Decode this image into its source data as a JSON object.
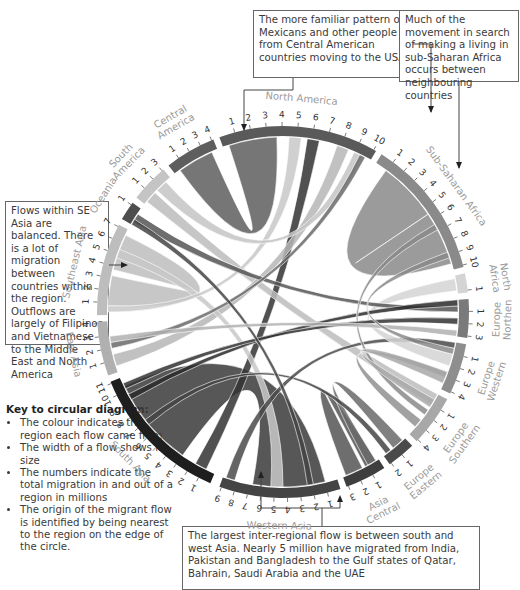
{
  "callouts": {
    "top": "The more familiar pattern of Mexicans and other people from Central American countries moving to the USA",
    "top_right": "Much of the movement in search of making a living in sub-Saharan Africa occurs between neighbouring countries",
    "left": "Flows within SE Asia are balanced. There is a lot of migration between countries within the region. Outflows are largely of Filipinos and Vietnamese to the Middle East and North America",
    "bottom": "The largest inter-regional flow is between south and west Asia. Nearly 5 million have migrated from India, Pakistan and Bangladesh to the Gulf states of Qatar, Bahrain, Saudi Arabia and the UAE"
  },
  "key": {
    "title": "Key to circular diagram:",
    "items": [
      "The colour indicates the region each flow came from",
      "The width of a flow shows its size",
      "The numbers indicate the total migration in and out of a region in millions",
      "The origin of the migrant flow is identified by being nearest to the region on the edge of the circle."
    ]
  },
  "chart_data": {
    "type": "chord",
    "title": "",
    "units": "millions (total migration in and out of a region)",
    "regions": [
      {
        "name": "North America",
        "label_lines": [
          "North America"
        ],
        "max_tick": 10,
        "color": "#5a5a5a",
        "start": -20,
        "end": 30
      },
      {
        "name": "Sub-Saharan Africa",
        "label_lines": [
          "Sub-Saharan Africa"
        ],
        "max_tick": 10,
        "color": "#8a8a8a",
        "start": 32,
        "end": 76
      },
      {
        "name": "North Africa",
        "label_lines": [
          "North",
          "Africa"
        ],
        "max_tick": 1,
        "color": "#d4d4d4",
        "start": 78,
        "end": 84
      },
      {
        "name": "Northern Europe",
        "label_lines": [
          "Northen",
          "Europe"
        ],
        "max_tick": 3,
        "color": "#7a7a7a",
        "start": 86,
        "end": 98
      },
      {
        "name": "Western Europe",
        "label_lines": [
          "Western",
          "Europe"
        ],
        "max_tick": 4,
        "color": "#8e8e8e",
        "start": 100,
        "end": 116
      },
      {
        "name": "Southern Europe",
        "label_lines": [
          "Southern",
          "Europe"
        ],
        "max_tick": 4,
        "color": "#a8a8a8",
        "start": 118,
        "end": 134
      },
      {
        "name": "Eastern Europe",
        "label_lines": [
          "Eastern",
          "Europe"
        ],
        "max_tick": 2,
        "color": "#4a4a4a",
        "start": 136,
        "end": 145
      },
      {
        "name": "Central Asia",
        "label_lines": [
          "Central",
          "Asia"
        ],
        "max_tick": 3,
        "color": "#3e3e3e",
        "start": 147,
        "end": 160
      },
      {
        "name": "Western Asia",
        "label_lines": [
          "Western Asia"
        ],
        "max_tick": 9,
        "color": "#444444",
        "start": 162,
        "end": 200
      },
      {
        "name": "South Asia",
        "label_lines": [
          "South Asia"
        ],
        "max_tick": 11,
        "color": "#1e1e1e",
        "start": 203,
        "end": 248
      },
      {
        "name": "East Asia",
        "label_lines": [
          "East Asia"
        ],
        "max_tick": 4,
        "color": "#b0b0b0",
        "start": 250,
        "end": 267
      },
      {
        "name": "Southeast Asia",
        "label_lines": [
          "Southeast Asia"
        ],
        "max_tick": 7,
        "color": "#bdbdbd",
        "start": 269,
        "end": 298
      },
      {
        "name": "Oceania",
        "label_lines": [
          "Oceania"
        ],
        "max_tick": 1,
        "color": "#4e4e4e",
        "start": 300,
        "end": 306
      },
      {
        "name": "South America",
        "label_lines": [
          "South",
          "America"
        ],
        "max_tick": 3,
        "color": "#c4c4c4",
        "start": 308,
        "end": 320
      },
      {
        "name": "Central America",
        "label_lines": [
          "Central",
          "America"
        ],
        "max_tick": 4,
        "color": "#5e5e5e",
        "start": 322,
        "end": 338
      }
    ],
    "flows": [
      {
        "from": "Sub-Saharan Africa",
        "a": [
          36,
          56
        ],
        "b": [
          56,
          74
        ],
        "color": "#8a8a8a"
      },
      {
        "from": "South Asia",
        "a": [
          215,
          245
        ],
        "b": [
          166,
          190
        ],
        "color": "#3a3a3a"
      },
      {
        "from": "Central America",
        "a": [
          324,
          336
        ],
        "b": [
          -18,
          -2
        ],
        "color": "#5e5e5e"
      },
      {
        "from": "Southeast Asia",
        "a": [
          272,
          282
        ],
        "b": [
          284,
          296
        ],
        "color": "#bdbdbd"
      },
      {
        "from": "Central Asia",
        "a": [
          148,
          152
        ],
        "b": [
          153,
          159
        ],
        "color": "#555555"
      },
      {
        "from": "Eastern Europe",
        "a": [
          137,
          141
        ],
        "b": [
          148,
          151
        ],
        "color": "#6a6a6a"
      },
      {
        "from": "South Asia",
        "a": [
          206,
          210
        ],
        "b": [
          8,
          12
        ],
        "color": "#333333"
      },
      {
        "from": "South America",
        "a": [
          309,
          313
        ],
        "b": [
          118,
          122
        ],
        "color": "#bcbcbc"
      },
      {
        "from": "East Asia",
        "a": [
          252,
          256
        ],
        "b": [
          18,
          22
        ],
        "color": "#b6b6b6"
      },
      {
        "from": "Southeast Asia",
        "a": [
          288,
          291
        ],
        "b": [
          180,
          184
        ],
        "color": "#c8c8c8"
      },
      {
        "from": "Southeast Asia",
        "a": [
          270,
          272
        ],
        "b": [
          2,
          6
        ],
        "color": "#c8c8c8"
      },
      {
        "from": "Eastern Europe",
        "a": [
          142,
          144
        ],
        "b": [
          230,
          232
        ],
        "color": "#444444"
      },
      {
        "from": "Western Asia",
        "a": [
          196,
          199
        ],
        "b": [
          100,
          102
        ],
        "color": "#4a4a4a"
      },
      {
        "from": "North Africa",
        "a": [
          79,
          83
        ],
        "b": [
          104,
          108
        ],
        "color": "#d4d4d4"
      },
      {
        "from": "South America",
        "a": [
          314,
          318
        ],
        "b": [
          24,
          27
        ],
        "color": "#c4c4c4"
      },
      {
        "from": "Oceania",
        "a": [
          301,
          304
        ],
        "b": [
          88,
          90
        ],
        "color": "#555555"
      },
      {
        "from": "South Asia",
        "a": [
          240,
          242
        ],
        "b": [
          86,
          88
        ],
        "color": "#2a2a2a"
      },
      {
        "from": "Sub-Saharan Africa",
        "a": [
          60,
          62
        ],
        "b": [
          124,
          126
        ],
        "color": "#8a8a8a"
      },
      {
        "from": "North America",
        "a": [
          26,
          28
        ],
        "b": [
          258,
          260
        ],
        "color": "#6a6a6a"
      },
      {
        "from": "Western Europe",
        "a": [
          110,
          112
        ],
        "b": [
          128,
          131
        ],
        "color": "#909090"
      },
      {
        "from": "Southern Europe",
        "a": [
          120,
          123
        ],
        "b": [
          110,
          114
        ],
        "color": "#a8a8a8"
      },
      {
        "from": "South Asia",
        "a": [
          244,
          246
        ],
        "b": [
          92,
          94
        ],
        "color": "#333333"
      },
      {
        "from": "Western Asia",
        "a": [
          170,
          172
        ],
        "b": [
          300,
          302
        ],
        "color": "#444444"
      },
      {
        "from": "East Asia",
        "a": [
          260,
          262
        ],
        "b": [
          96,
          98
        ],
        "color": "#b0b0b0"
      },
      {
        "from": "Sub-Saharan Africa",
        "a": [
          70,
          72
        ],
        "b": [
          102,
          104
        ],
        "color": "#8a8a8a"
      }
    ]
  }
}
